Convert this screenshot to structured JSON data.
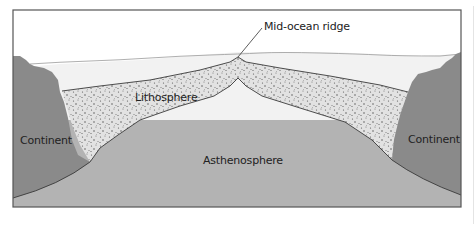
{
  "diagram": {
    "labels": {
      "ridge": "Mid-ocean ridge",
      "lithosphere": "Lithosphere",
      "asthenosphere": "Asthenosphere",
      "continent_left": "Continent",
      "continent_right": "Continent"
    },
    "colors": {
      "frame": "#555555",
      "ocean": "#f2f2f2",
      "sky": "#ffffff",
      "lithosphere": "#e2e2e2",
      "lithosphere_dots": "#555555",
      "asthenosphere": "#b3b3b3",
      "continent": "#8a8a8a",
      "outline": "#3a3a3a"
    }
  }
}
